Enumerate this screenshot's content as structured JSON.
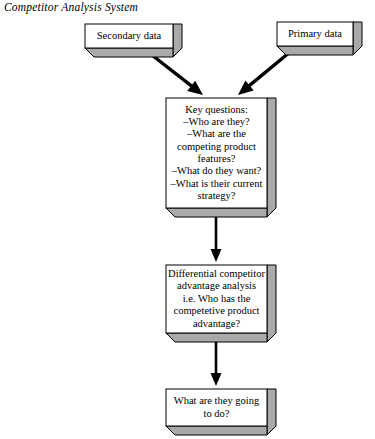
{
  "diagram": {
    "title": "Competitor Analysis System",
    "type": "flowchart",
    "style": {
      "box_face": "#ffffff",
      "box_side": "#a9a9a9",
      "box_bottom": "#a9a9a9",
      "box_stroke": "#000000",
      "arrow_color": "#000000",
      "page_background": "#ffffff"
    },
    "nodes": [
      {
        "id": "secondary-data",
        "label": "Secondary data",
        "font_size": 10.5,
        "x": 85,
        "y": 24,
        "width": 88,
        "height": 24,
        "depth": 9
      },
      {
        "id": "primary-data",
        "label": "Primary data",
        "font_size": 10.5,
        "x": 277,
        "y": 22,
        "width": 76,
        "height": 24,
        "depth": 9
      },
      {
        "id": "key-questions",
        "label": "Key questions:\n–Who are they?\n–What are the\ncompeting product\nfeatures?\n–What do they want?\n–What is their current\nstrategy?",
        "font_size": 10.5,
        "x": 166,
        "y": 98,
        "width": 101,
        "height": 110,
        "depth": 9
      },
      {
        "id": "differential-advantage",
        "label": "Differential competitor\nadvantage analysis\ni.e. Who has the\ncompetetive product\nadvantage?",
        "font_size": 10.5,
        "x": 166,
        "y": 265,
        "width": 101,
        "height": 68,
        "depth": 9
      },
      {
        "id": "what-next",
        "label": "What are they going\nto do?",
        "font_size": 10.5,
        "x": 166,
        "y": 389,
        "width": 101,
        "height": 37,
        "depth": 9
      }
    ],
    "edges": [
      {
        "id": "secondary-to-questions",
        "from": "secondary-data",
        "to": "key-questions",
        "kind": "diagonal-arrow",
        "x1": 148,
        "y1": 52,
        "x2": 203,
        "y2": 95
      },
      {
        "id": "primary-to-questions",
        "from": "primary-data",
        "to": "key-questions",
        "kind": "diagonal-arrow",
        "x1": 290,
        "y1": 52,
        "x2": 238,
        "y2": 95
      },
      {
        "id": "questions-to-advantage",
        "from": "key-questions",
        "to": "differential-advantage",
        "kind": "vertical-arrow",
        "x1": 216,
        "y1": 208,
        "x2": 216,
        "y2": 262
      },
      {
        "id": "advantage-to-what-next",
        "from": "differential-advantage",
        "to": "what-next",
        "kind": "vertical-arrow",
        "x1": 216,
        "y1": 333,
        "x2": 216,
        "y2": 386
      }
    ]
  }
}
